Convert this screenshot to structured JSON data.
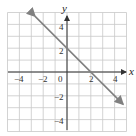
{
  "chart_data": {
    "type": "line",
    "title": "",
    "xlabel": "x",
    "ylabel": "y",
    "xlim": [
      -5,
      5
    ],
    "ylim": [
      -5,
      5
    ],
    "grid": true,
    "grid_step": 1,
    "x_ticks": [
      -4,
      -2,
      0,
      2,
      4
    ],
    "y_ticks": [
      4,
      2,
      -2,
      -4
    ],
    "x_tick_labels": [
      "−4",
      "−2",
      "0",
      "2",
      "4"
    ],
    "y_tick_labels": [
      "4",
      "2",
      "−2",
      "−4"
    ],
    "series": [
      {
        "name": "y = -x + 2",
        "equation": "y = -x + 2",
        "slope": -1,
        "intercept": 2,
        "x": [
          -2.7,
          4.7
        ],
        "y": [
          4.7,
          -2.7
        ],
        "arrows": "both",
        "color": "#808080"
      }
    ],
    "points_of_note": [
      {
        "x": 0,
        "y": 2
      },
      {
        "x": 2,
        "y": 0
      }
    ]
  },
  "labels": {
    "x_axis": "x",
    "y_axis": "y",
    "origin": "0",
    "xticks": [
      "−4",
      "−2",
      "2",
      "4"
    ],
    "yticks": [
      "4",
      "2",
      "−2",
      "−4"
    ]
  },
  "colors": {
    "grid": "#c8c8c8",
    "axis": "#333333",
    "line": "#808080"
  }
}
